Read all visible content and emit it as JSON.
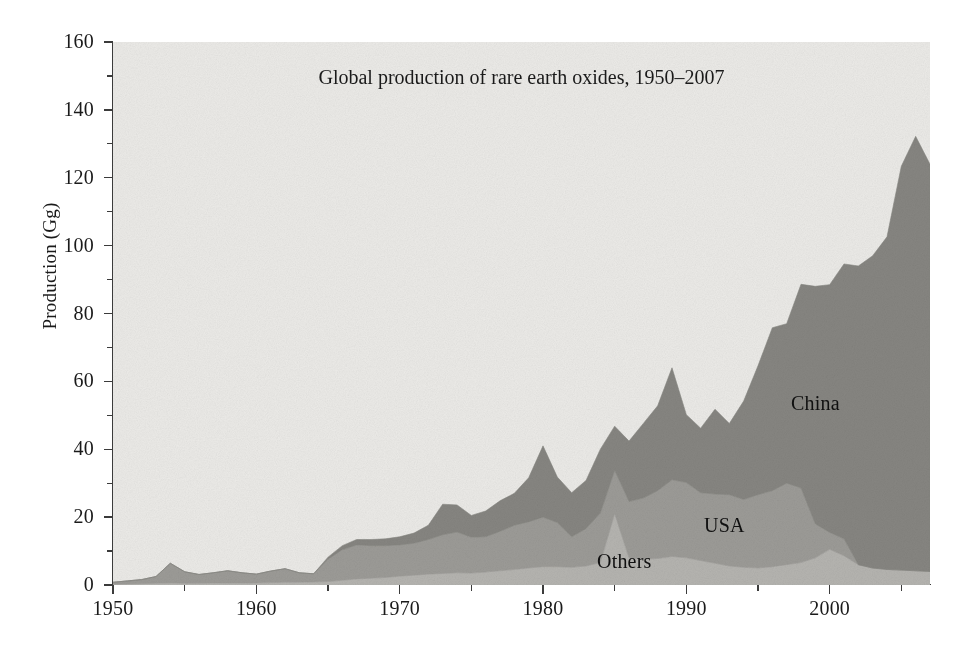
{
  "chart_data": {
    "type": "area",
    "stacked": true,
    "title": "Global production of rare earth oxides, 1950–2007",
    "xlabel": "",
    "ylabel": "Production (Gg)",
    "xlim": [
      1950,
      2007
    ],
    "ylim": [
      0,
      160
    ],
    "grid": false,
    "legend_position": "inline-annotations",
    "x_ticks": [
      1950,
      1960,
      1970,
      1980,
      1990,
      2000
    ],
    "x_minor_ticks": [
      1955,
      1965,
      1975,
      1985,
      1995,
      2005
    ],
    "y_ticks": [
      0,
      20,
      40,
      60,
      80,
      100,
      120,
      140,
      160
    ],
    "y_minor_ticks": [
      10,
      30,
      50,
      70,
      90,
      110,
      130,
      150
    ],
    "x": [
      1950,
      1951,
      1952,
      1953,
      1954,
      1955,
      1956,
      1957,
      1958,
      1959,
      1960,
      1961,
      1962,
      1963,
      1964,
      1965,
      1966,
      1967,
      1968,
      1969,
      1970,
      1971,
      1972,
      1973,
      1974,
      1975,
      1976,
      1977,
      1978,
      1979,
      1980,
      1981,
      1982,
      1983,
      1984,
      1985,
      1986,
      1987,
      1988,
      1989,
      1990,
      1991,
      1992,
      1993,
      1994,
      1995,
      1996,
      1997,
      1998,
      1999,
      2000,
      2001,
      2002,
      2003,
      2004,
      2005,
      2006,
      2007
    ],
    "series": [
      {
        "name": "Others",
        "color": "#b6b5b1",
        "values": [
          0.2,
          0.3,
          0.4,
          0.5,
          0.6,
          0.5,
          0.5,
          0.6,
          0.6,
          0.6,
          0.6,
          0.7,
          0.8,
          0.8,
          0.9,
          1.0,
          1.4,
          1.8,
          2.0,
          2.2,
          2.6,
          2.9,
          3.2,
          3.4,
          3.6,
          3.5,
          3.8,
          4.2,
          4.6,
          5.0,
          5.4,
          5.4,
          5.2,
          5.6,
          6.6,
          21.0,
          8.0,
          7.6,
          7.8,
          8.4,
          8.0,
          7.2,
          6.4,
          5.6,
          5.2,
          5.0,
          5.4,
          6.0,
          6.6,
          8.0,
          10.5,
          8.6,
          6.0,
          5.0,
          4.6,
          4.4,
          4.2,
          4.0
        ]
      },
      {
        "name": "USA",
        "color": "#9d9c98",
        "values": [
          0.6,
          0.9,
          1.2,
          2.0,
          5.8,
          3.4,
          2.6,
          3.0,
          3.6,
          3.0,
          2.6,
          3.4,
          4.0,
          2.8,
          2.4,
          6.6,
          9.0,
          10.0,
          9.6,
          9.4,
          9.2,
          9.4,
          10.2,
          11.4,
          12.0,
          10.6,
          10.4,
          11.6,
          13.0,
          13.6,
          14.6,
          13.0,
          9.0,
          11.0,
          14.6,
          12.8,
          16.6,
          18.0,
          20.0,
          22.6,
          22.2,
          20.0,
          20.4,
          21.0,
          20.0,
          21.6,
          22.4,
          24.0,
          22.0,
          10.0,
          5.0,
          5.0,
          0.0,
          0.0,
          0.0,
          0.0,
          0.0,
          0.0
        ]
      },
      {
        "name": "China",
        "color": "#878682",
        "values": [
          0.0,
          0.0,
          0.0,
          0.0,
          0.0,
          0.0,
          0.0,
          0.0,
          0.0,
          0.0,
          0.0,
          0.0,
          0.0,
          0.0,
          0.0,
          0.6,
          1.2,
          1.6,
          1.8,
          2.0,
          2.4,
          3.0,
          4.2,
          9.0,
          8.0,
          6.4,
          7.6,
          9.0,
          9.4,
          13.0,
          21.0,
          13.4,
          13.0,
          14.2,
          18.8,
          13.0,
          17.8,
          22.0,
          25.0,
          33.0,
          20.0,
          19.0,
          25.0,
          21.0,
          29.0,
          38.0,
          48.0,
          47.0,
          60.0,
          70.0,
          73.0,
          81.0,
          88.0,
          92.0,
          98.0,
          119.0,
          128.0,
          120.0
        ]
      }
    ],
    "annotations": [
      {
        "text": "China",
        "x": 2000,
        "y": 95
      },
      {
        "text": "USA",
        "x": 1996,
        "y": 14
      },
      {
        "text": "Others",
        "x": 1990,
        "y": 4
      }
    ]
  },
  "axes": {
    "y_title": "Production (Gg)",
    "y_tick_labels": [
      "0",
      "20",
      "40",
      "60",
      "80",
      "100",
      "120",
      "140",
      "160"
    ],
    "x_tick_labels": [
      "1950",
      "1960",
      "1970",
      "1980",
      "1990",
      "2000"
    ]
  },
  "title": "Global production of rare earth oxides, 1950–2007",
  "labels": {
    "china": "China",
    "usa": "USA",
    "others": "Others"
  },
  "colors": {
    "background": "#edece9",
    "others": "#b6b5b1",
    "usa": "#9d9c98",
    "china": "#878682",
    "axis": "#3b3b3b",
    "text": "#1a1a1a"
  }
}
